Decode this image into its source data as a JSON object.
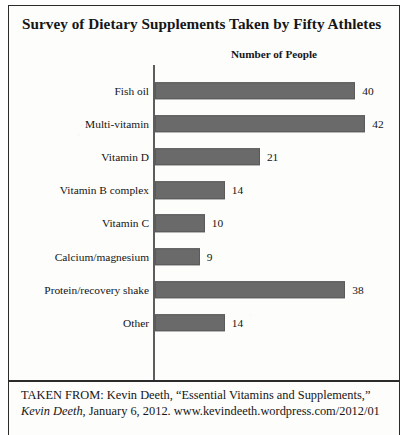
{
  "figure": {
    "title": "Survey of Dietary Supplements Taken by Fifty Athletes",
    "axis_caption": "Number of People",
    "citation_line1": "TAKEN FROM: Kevin Deeth, “Essential Vitamins and Supplements,”",
    "citation_source_italic": "Kevin Deeth",
    "citation_line2_rest": ", January 6, 2012. www.kevindeeth.wordpress.com/2012/01"
  },
  "colors": {
    "bar": "#6a6a6a",
    "axis": "#5d5d5d",
    "frame": "#2b2b2b",
    "text": "#141414",
    "paper": "#fdfdfc"
  },
  "chart_data": {
    "type": "bar",
    "orientation": "horizontal",
    "title": "Survey of Dietary Supplements Taken by Fifty Athletes",
    "subtitle": "Number of People",
    "xlabel": "Number of People",
    "ylabel": "",
    "grid": false,
    "legend": null,
    "xlim": [
      0,
      42
    ],
    "categories": [
      "Fish oil",
      "Multi-vitamin",
      "Vitamin D",
      "Vitamin B complex",
      "Vitamin C",
      "Calcium/magnesium",
      "Protein/recovery shake",
      "Other"
    ],
    "values": [
      40,
      42,
      21,
      14,
      10,
      9,
      38,
      14
    ],
    "data_labels": [
      "40",
      "42",
      "21",
      "14",
      "10",
      "9",
      "38",
      "14"
    ]
  }
}
